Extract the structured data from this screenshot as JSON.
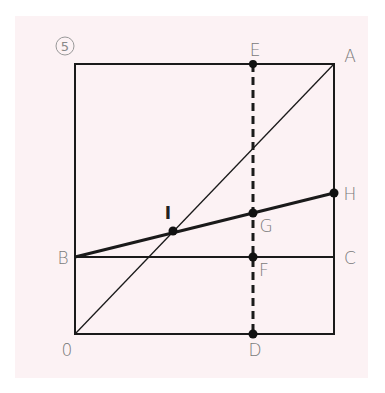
{
  "figure": {
    "badge": "5",
    "background_color": "#fcf2f4",
    "line_color": "#1a1a1a",
    "label_color": "#7a7a7a"
  },
  "points": {
    "O": {
      "label": "0",
      "x": 75,
      "y": 334
    },
    "A": {
      "label": "A",
      "x": 334,
      "y": 64
    },
    "B": {
      "label": "B",
      "x": 75,
      "y": 257
    },
    "C": {
      "label": "C",
      "x": 334,
      "y": 257
    },
    "D": {
      "label": "D",
      "x": 253,
      "y": 334
    },
    "E": {
      "label": "E",
      "x": 253,
      "y": 64
    },
    "F": {
      "label": "F",
      "x": 253,
      "y": 257
    },
    "G": {
      "label": "G",
      "x": 253,
      "y": 213
    },
    "H": {
      "label": "H",
      "x": 334,
      "y": 193
    },
    "I": {
      "label": "I",
      "x": 173,
      "y": 231
    }
  },
  "segments": [
    {
      "name": "square",
      "from": "O",
      "to": "A",
      "style": "rect"
    },
    {
      "name": "diagonal-OA",
      "from": "O",
      "to": "A",
      "style": "thin"
    },
    {
      "name": "line-BC",
      "from": "B",
      "to": "C",
      "style": "normal"
    },
    {
      "name": "line-BH",
      "from": "B",
      "to": "H",
      "style": "thick"
    },
    {
      "name": "dashed-ED",
      "from": "E",
      "to": "D",
      "style": "dashed"
    }
  ]
}
